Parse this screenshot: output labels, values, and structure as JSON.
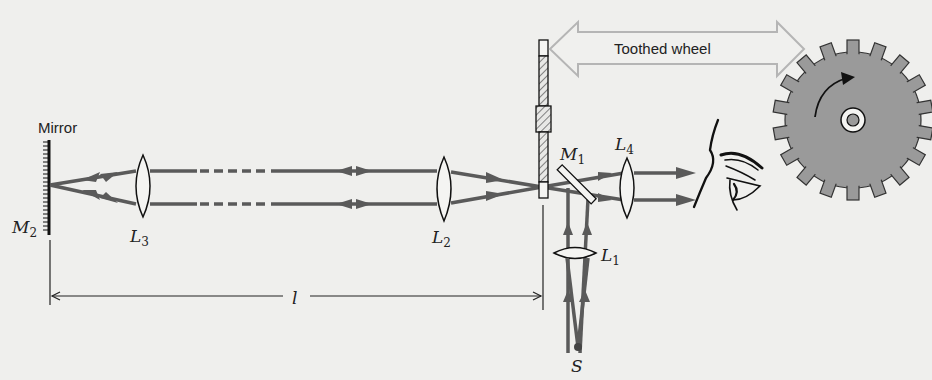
{
  "diagram": {
    "labels": {
      "mirror": "Mirror",
      "m2": "M",
      "m2_sub": "2",
      "m1": "M",
      "m1_sub": "1",
      "l1": "L",
      "l1_sub": "1",
      "l2": "L",
      "l2_sub": "2",
      "l3": "L",
      "l3_sub": "3",
      "l4": "L",
      "l4_sub": "4",
      "source": "S",
      "distance": "l",
      "toothed_wheel": "Toothed wheel"
    },
    "colors": {
      "background": "#efefed",
      "beam": "#5a5a5a",
      "wheel_fill": "#9a9a9a",
      "outline": "#1a1a1a",
      "callout_arrow": "#b8b8b8"
    }
  }
}
